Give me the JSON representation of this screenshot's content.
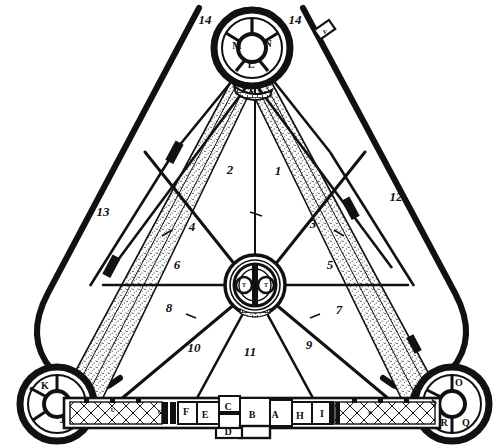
{
  "figure": {
    "kind": "architectural-plan",
    "ink_color": "#111111",
    "paper_color": "#ffffff"
  },
  "sector_numbers": [
    {
      "id": "1",
      "label": "1",
      "x": 278,
      "y": 170
    },
    {
      "id": "2",
      "label": "2",
      "x": 230,
      "y": 169
    },
    {
      "id": "3",
      "label": "3",
      "x": 313,
      "y": 223
    },
    {
      "id": "4",
      "label": "4",
      "x": 192,
      "y": 226
    },
    {
      "id": "5",
      "label": "5",
      "x": 330,
      "y": 264
    },
    {
      "id": "6",
      "label": "6",
      "x": 177,
      "y": 264
    },
    {
      "id": "7",
      "label": "7",
      "x": 339,
      "y": 309
    },
    {
      "id": "8",
      "label": "8",
      "x": 169,
      "y": 307
    },
    {
      "id": "9",
      "label": "9",
      "x": 309,
      "y": 344
    },
    {
      "id": "10",
      "label": "10",
      "x": 194,
      "y": 347
    },
    {
      "id": "11",
      "label": "11",
      "x": 250,
      "y": 351
    },
    {
      "id": "12",
      "label": "12",
      "x": 396,
      "y": 196
    },
    {
      "id": "13",
      "label": "13",
      "x": 103,
      "y": 211
    },
    {
      "id": "14a",
      "label": "14",
      "x": 205,
      "y": 19
    },
    {
      "id": "14b",
      "label": "14",
      "x": 295,
      "y": 19
    }
  ],
  "towers": {
    "north": {
      "name": "north-bastion",
      "letters": [
        {
          "id": "M",
          "label": "M",
          "x": 237,
          "y": 46
        },
        {
          "id": "N",
          "label": "N",
          "x": 268,
          "y": 44
        },
        {
          "id": "L",
          "label": "L",
          "x": 251,
          "y": 65
        }
      ]
    },
    "southwest": {
      "name": "southwest-bastion",
      "letters": [
        {
          "id": "K",
          "label": "K",
          "x": 45,
          "y": 386
        },
        {
          "id": "J",
          "label": "J",
          "x": 62,
          "y": 420
        }
      ]
    },
    "southeast": {
      "name": "southeast-bastion",
      "letters": [
        {
          "id": "O",
          "label": "O",
          "x": 459,
          "y": 383
        },
        {
          "id": "S",
          "label": "S",
          "x": 434,
          "y": 402
        },
        {
          "id": "R",
          "label": "R",
          "x": 444,
          "y": 423
        },
        {
          "id": "Q",
          "label": "Q",
          "x": 466,
          "y": 423
        }
      ]
    }
  },
  "center_rotunda": {
    "name": "central-rotunda",
    "letters": [
      {
        "id": "T-left",
        "label": "T",
        "x": 244,
        "y": 285
      },
      {
        "id": "T-right",
        "label": "T",
        "x": 266,
        "y": 285
      }
    ]
  },
  "south_range_rooms": [
    {
      "id": "A",
      "label": "A",
      "x": 275,
      "y": 415
    },
    {
      "id": "B",
      "label": "B",
      "x": 252,
      "y": 415
    },
    {
      "id": "C",
      "label": "C",
      "x": 228,
      "y": 407
    },
    {
      "id": "D",
      "label": "D",
      "x": 228,
      "y": 432
    },
    {
      "id": "E",
      "label": "E",
      "x": 205,
      "y": 415
    },
    {
      "id": "F",
      "label": "F",
      "x": 186,
      "y": 412
    },
    {
      "id": "H",
      "label": "H",
      "x": 300,
      "y": 416
    },
    {
      "id": "I",
      "label": "I",
      "x": 322,
      "y": 414
    }
  ],
  "small_marks": [
    {
      "id": "V-mark",
      "label": "V",
      "x": 325,
      "y": 32
    },
    {
      "id": "P-mark",
      "label": "P",
      "x": 370,
      "y": 413
    },
    {
      "id": "G-mark",
      "label": "G",
      "x": 160,
      "y": 412
    },
    {
      "id": "U-mark",
      "label": "U",
      "x": 113,
      "y": 410
    }
  ]
}
